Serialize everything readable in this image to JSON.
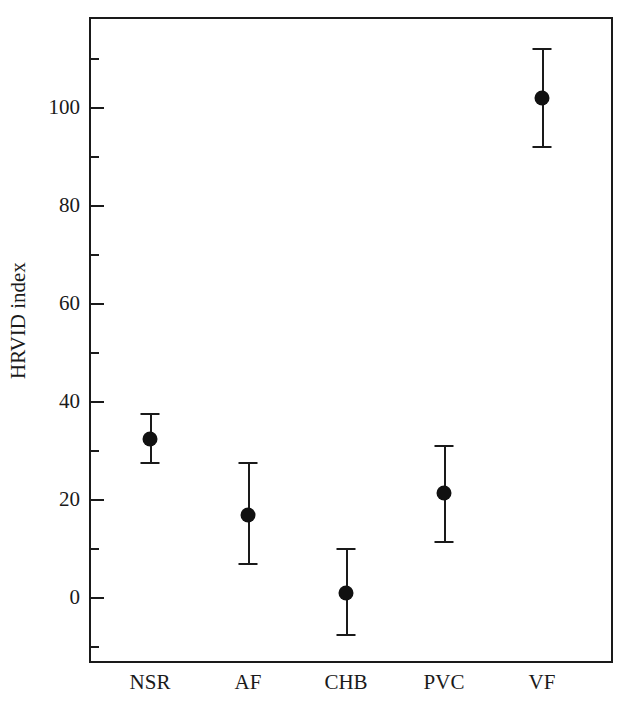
{
  "chart_data": {
    "type": "scatter",
    "title": "",
    "xlabel": "",
    "ylabel": "HRVID index",
    "categories": [
      "NSR",
      "AF",
      "CHB",
      "PVC",
      "VF"
    ],
    "values": [
      32.5,
      17.0,
      1.0,
      21.5,
      102.0
    ],
    "error_low": [
      27.5,
      7.0,
      -7.5,
      11.5,
      92.0
    ],
    "error_high": [
      37.5,
      27.5,
      10.0,
      31.0,
      112.0
    ],
    "series": [
      {
        "name": "HRVID index",
        "points": [
          {
            "category": "NSR",
            "value": 32.5,
            "low": 27.5,
            "high": 37.5
          },
          {
            "category": "AF",
            "value": 17.0,
            "low": 7.0,
            "high": 27.5
          },
          {
            "category": "CHB",
            "value": 1.0,
            "low": -7.5,
            "high": 10.0
          },
          {
            "category": "PVC",
            "value": 21.5,
            "low": 11.5,
            "high": 31.0
          },
          {
            "category": "VF",
            "value": 102.0,
            "low": 92.0,
            "high": 112.0
          }
        ]
      }
    ],
    "ylim": [
      -14,
      117
    ],
    "ytick_major": [
      0,
      20,
      40,
      60,
      80,
      100
    ],
    "ytick_major_labels": [
      "0",
      "20",
      "40",
      "60",
      "80",
      "100"
    ],
    "ytick_minor": [
      -10,
      10,
      30,
      50,
      70,
      90,
      110
    ],
    "grid": false,
    "legend": "none",
    "marker": "filled-circle",
    "marker_color": "#111111",
    "line_color": "#1a1a1a",
    "background": "#ffffff"
  },
  "axes": {
    "y_label": "HRVID index",
    "y_tick_labels": [
      "100",
      "80",
      "60",
      "40",
      "20",
      "0"
    ],
    "x_tick_labels": [
      "NSR",
      "AF",
      "CHB",
      "PVC",
      "VF"
    ]
  }
}
